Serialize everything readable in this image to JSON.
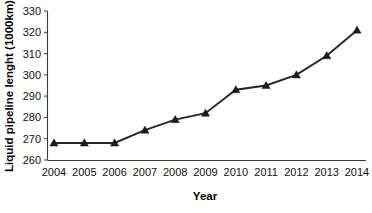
{
  "chart_data": {
    "type": "line",
    "title": "",
    "xlabel": "Year",
    "ylabel": "Liquid pipeline lenght (1000km)",
    "categories": [
      "2004",
      "2005",
      "2006",
      "2007",
      "2008",
      "2009",
      "2010",
      "2011",
      "2012",
      "2013",
      "2014"
    ],
    "x": [
      2004,
      2005,
      2006,
      2007,
      2008,
      2009,
      2010,
      2011,
      2012,
      2013,
      2014
    ],
    "values": [
      268,
      268,
      268,
      274,
      279,
      282,
      293,
      295,
      300,
      309,
      321
    ],
    "series": [
      {
        "name": "Liquid pipeline length",
        "values": [
          268,
          268,
          268,
          274,
          279,
          282,
          293,
          295,
          300,
          309,
          321
        ]
      }
    ],
    "ylim": [
      260,
      330
    ],
    "ytick_labels": [
      "260",
      "270",
      "280",
      "290",
      "300",
      "310",
      "320",
      "330"
    ],
    "yticks": [
      260,
      270,
      280,
      290,
      300,
      310,
      320,
      330
    ],
    "xtick_labels": [
      "2004",
      "2005",
      "2006",
      "2007",
      "2008",
      "2009",
      "2010",
      "2011",
      "2012",
      "2013",
      "2014"
    ],
    "grid": false,
    "legend": false,
    "marker": "triangle",
    "line_color": "#262626",
    "marker_color": "#1c1c1c",
    "axis_color": "#3a3a3a"
  }
}
